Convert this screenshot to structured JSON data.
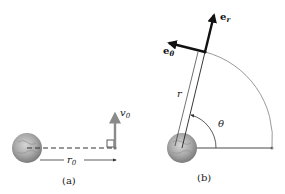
{
  "panels": [
    {
      "id": "a",
      "caption": "(a)",
      "labels": {
        "velocity": "v",
        "velocity_sub": "0",
        "radius": "r",
        "radius_sub": "0"
      }
    },
    {
      "id": "b",
      "caption": "(b)",
      "labels": {
        "radial_unit": "e",
        "radial_unit_sub": "r",
        "transverse_unit": "e",
        "transverse_unit_sub": "θ",
        "radius": "r",
        "angle": "θ"
      }
    }
  ],
  "colors": {
    "vector_gray": "#8a8a8a",
    "unit_vector": "#111111",
    "arc": "#9a9a9a",
    "planet_light": "#c8c8c8",
    "planet_dark": "#7c7c7c"
  }
}
